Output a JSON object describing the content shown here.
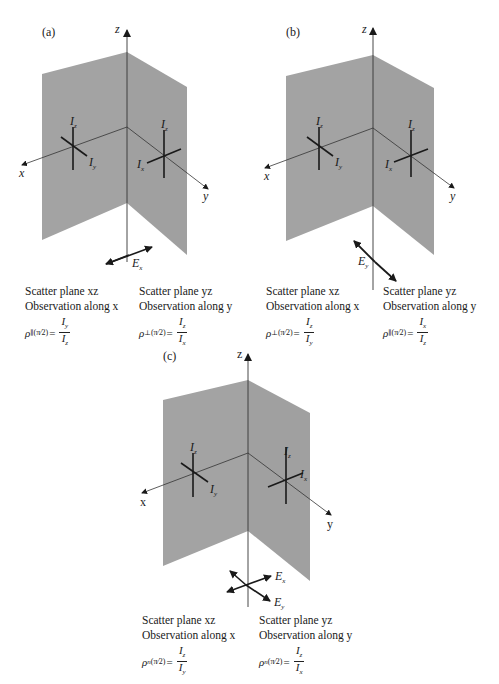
{
  "figure": {
    "plane_color": "#a3a3a3",
    "line_color": "#1a1a1a",
    "panels": [
      {
        "tag": "(a)",
        "axes": {
          "x": "x",
          "y": "y",
          "z": "z"
        },
        "left_plane": {
          "labels": {
            "vertical": "Iz",
            "horizontal": "Iy"
          }
        },
        "right_plane": {
          "labels": {
            "vertical": "Iz",
            "horizontal": "Ix"
          }
        },
        "field_label": "Ex",
        "captions": [
          {
            "line1": "Scatter plane xz",
            "line2": "Observation along x",
            "rho": "ρ∥",
            "arg": "(π/2)",
            "num": "Iy",
            "den": "Iz"
          },
          {
            "line1": "Scatter plane yz",
            "line2": "Observation along y",
            "rho": "ρ⊥",
            "arg": "(π/2)",
            "num": "Iz",
            "den": "Ix"
          }
        ]
      },
      {
        "tag": "(b)",
        "axes": {
          "x": "x",
          "y": "y",
          "z": "z"
        },
        "left_plane": {
          "labels": {
            "vertical": "Iz",
            "horizontal": "Iy"
          }
        },
        "right_plane": {
          "labels": {
            "vertical": "Iz",
            "horizontal": "Ix"
          }
        },
        "field_label": "Ey",
        "captions": [
          {
            "line1": "Scatter plane xz",
            "line2": "Observation along x",
            "rho": "ρ⊥",
            "arg": "(π/2)",
            "num": "Iz",
            "den": "Iy"
          },
          {
            "line1": "Scatter plane yz",
            "line2": "Observation along y",
            "rho": "ρ∥",
            "arg": "(π/2)",
            "num": "Ix",
            "den": "Iz"
          }
        ]
      },
      {
        "tag": "(c)",
        "axes": {
          "x": "x",
          "y": "y",
          "z": "z"
        },
        "left_plane": {
          "labels": {
            "vertical": "Iz",
            "horizontal": "Iy"
          }
        },
        "right_plane": {
          "labels": {
            "vertical": "Iz",
            "horizontal": "Ix"
          }
        },
        "field_labels": [
          "Ex",
          "Ey"
        ],
        "captions": [
          {
            "line1": "Scatter plane xz",
            "line2": "Observation along x",
            "rho": "ρn",
            "arg": "(π/2)",
            "num": "Iz",
            "den": "Iy"
          },
          {
            "line1": "Scatter plane yz",
            "line2": "Observation along y",
            "rho": "ρn",
            "arg": "(π/2)",
            "num": "Iz",
            "den": "Ix"
          }
        ]
      }
    ]
  },
  "text": {
    "a_tag": "(a)",
    "b_tag": "(b)",
    "c_tag": "(c)",
    "x": "x",
    "y": "y",
    "z": "z",
    "I": "I",
    "z_sub": "z",
    "y_sub": "y",
    "x_sub": "x",
    "E": "E",
    "eq": "=",
    "arg": "(π⁄2)",
    "a_cap1_l1": "Scatter plane xz",
    "a_cap1_l2": "Observation along x",
    "a_cap2_l1": "Scatter plane yz",
    "a_cap2_l2": "Observation along y",
    "b_cap1_l1": "Scatter plane xz",
    "b_cap1_l2": "Observation along x",
    "b_cap2_l1": "Scatter plane yz",
    "b_cap2_l2": "Observation along y",
    "c_cap1_l1": "Scatter plane xz",
    "c_cap1_l2": "Observation along x",
    "c_cap2_l1": "Scatter plane yz",
    "c_cap2_l2": "Observation along y",
    "rho": "ρ",
    "par": "∥",
    "perp": "⊥",
    "n": "n"
  }
}
